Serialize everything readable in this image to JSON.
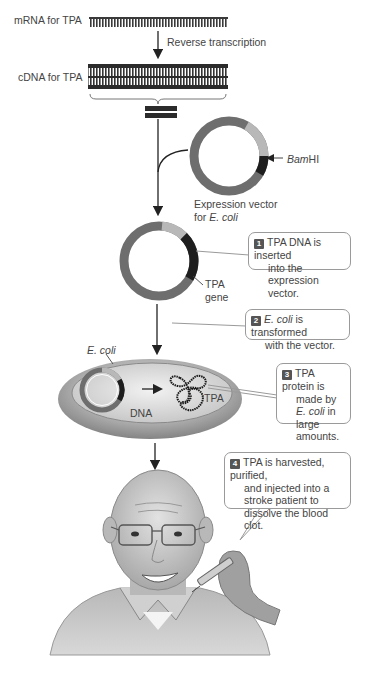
{
  "diagram": {
    "labels": {
      "mrna": "mRNA for TPA",
      "reverse_transcription": "Reverse transcription",
      "cdna": "cDNA for TPA",
      "bamhi_italic": "Bam",
      "bamhi_rest": "HI",
      "vector_line1": "Expression vector",
      "vector_line2_prefix": "for ",
      "vector_line2_italic": "E. coli",
      "tpa_gene_line1": "TPA",
      "tpa_gene_line2": "gene",
      "ecoli": "E. coli",
      "dna": "DNA",
      "tpa": "TPA"
    },
    "steps": [
      {
        "number": "1",
        "lines": [
          "TPA DNA is inserted",
          "into the expression",
          "vector."
        ]
      },
      {
        "number": "2",
        "italic_lead": "E. coli",
        "lines": [
          " is transformed",
          "with the vector."
        ]
      },
      {
        "number": "3",
        "lines": [
          "TPA protein is",
          "made by",
          "E. coli",
          " in large",
          "amounts."
        ]
      },
      {
        "number": "4",
        "lines": [
          "TPA is harvested, purified,",
          "and injected into a",
          "stroke patient to",
          "dissolve the blood clot."
        ]
      }
    ],
    "colors": {
      "strand_dark": "#2b2b2b",
      "vector_ring": "#6e6e6e",
      "vector_highlight": "#b8b8b8",
      "tpa_insert": "#1e1e1e",
      "badge": "#555555",
      "cell_body": "#a8a8a8",
      "cell_inner": "#d6d6d6"
    }
  }
}
